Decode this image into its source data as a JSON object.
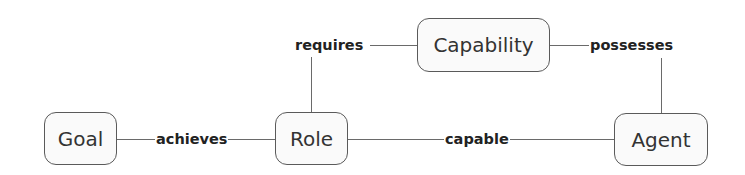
{
  "diagram": {
    "type": "concept-map",
    "nodes": [
      {
        "id": "goal",
        "label": "Goal"
      },
      {
        "id": "role",
        "label": "Role"
      },
      {
        "id": "capability",
        "label": "Capability"
      },
      {
        "id": "agent",
        "label": "Agent"
      }
    ],
    "edges": [
      {
        "from": "goal",
        "to": "role",
        "label": "achieves"
      },
      {
        "from": "role",
        "to": "capability",
        "label": "requires"
      },
      {
        "from": "agent",
        "to": "capability",
        "label": "possesses"
      },
      {
        "from": "role",
        "to": "agent",
        "label": "capable"
      }
    ],
    "colors": {
      "border": "#5a5a5a",
      "line": "#6a6a6a",
      "text": "#333333",
      "node_fill": "#fafafa"
    }
  }
}
